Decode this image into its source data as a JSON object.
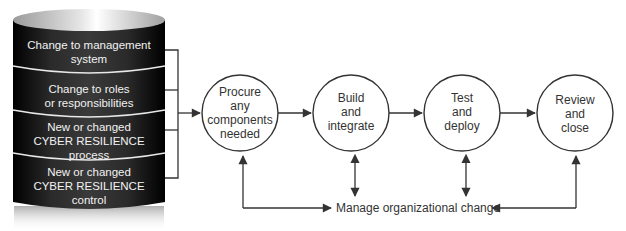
{
  "diagram": {
    "type": "process-flow",
    "colors": {
      "cylinder_dark": "#1a1a1a",
      "cylinder_text": "#f2f2f2",
      "line": "#333333",
      "circle_stroke": "#333333",
      "background": "#ffffff"
    },
    "cylinder": {
      "bands": [
        {
          "lines": [
            "Change to management",
            "system"
          ]
        },
        {
          "lines": [
            "Change to roles",
            "or responsibilities"
          ]
        },
        {
          "lines": [
            "New or changed",
            "CYBER RESILIENCE",
            "process"
          ]
        },
        {
          "lines": [
            "New or changed",
            "CYBER RESILIENCE",
            "control"
          ]
        }
      ]
    },
    "steps": [
      {
        "lines": [
          "Procure",
          "any",
          "components",
          "needed"
        ]
      },
      {
        "lines": [
          "Build",
          "and",
          "integrate"
        ]
      },
      {
        "lines": [
          "Test",
          "and",
          "deploy"
        ]
      },
      {
        "lines": [
          "Review",
          "and",
          "close"
        ]
      }
    ],
    "bottom_node": {
      "label": "Manage organizational change"
    },
    "edges": [
      {
        "from": "cylinder",
        "to": "steps.0",
        "type": "arrow"
      },
      {
        "from": "steps.0",
        "to": "steps.1",
        "type": "arrow"
      },
      {
        "from": "steps.1",
        "to": "steps.2",
        "type": "arrow"
      },
      {
        "from": "steps.2",
        "to": "steps.3",
        "type": "arrow"
      },
      {
        "from": "bottom_node",
        "to": "steps.0",
        "type": "arrow"
      },
      {
        "from": "steps.0",
        "to": "bottom_node",
        "type": "arrow"
      },
      {
        "from": "steps.1",
        "to": "bottom_node",
        "type": "double-arrow"
      },
      {
        "from": "steps.2",
        "to": "bottom_node",
        "type": "double-arrow"
      },
      {
        "from": "bottom_node",
        "to": "steps.3",
        "type": "arrow"
      },
      {
        "from": "steps.3",
        "to": "bottom_node",
        "type": "arrow"
      }
    ]
  }
}
